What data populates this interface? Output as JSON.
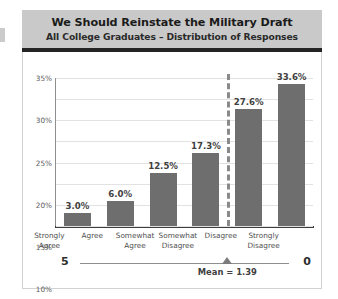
{
  "header": {
    "title": "We Should Reinstate the Military Draft",
    "subtitle": "All College Graduates – Distribution of Responses"
  },
  "scale": {
    "left_value": "5",
    "right_value": "0",
    "mean_label": "Mean = 1.39",
    "mean_value": 1.39
  },
  "colors": {
    "bar": "#6e6e6e",
    "header_band": "#c9c9c9",
    "header_rule": "#242424",
    "gridline": "#e2e2e2",
    "mean_line": "#8a8a8a"
  },
  "chart_data": {
    "type": "bar",
    "title": "We Should Reinstate the Military Draft",
    "subtitle": "All College Graduates – Distribution of Responses",
    "xlabel": "",
    "ylabel": "",
    "categories": [
      "Strongly Agree",
      "Agree",
      "Somewhat Agree",
      "Somewhat Disagree",
      "Disagree",
      "Strongly Disagree"
    ],
    "category_lines": [
      [
        "Strongly",
        "Agree"
      ],
      [
        "Agree",
        ""
      ],
      [
        "Somewhat",
        "Agree"
      ],
      [
        "Somewhat",
        "Disagree"
      ],
      [
        "Disagree",
        ""
      ],
      [
        "Strongly",
        "Disagree"
      ]
    ],
    "values": [
      3.0,
      6.0,
      12.5,
      17.3,
      27.6,
      33.6
    ],
    "data_labels": [
      "3.0%",
      "6.0%",
      "12.5%",
      "17.3%",
      "27.6%",
      "33.6%"
    ],
    "ylim": [
      0,
      35
    ],
    "ytick_values": [
      0,
      5,
      10,
      15,
      20,
      25,
      30,
      35
    ],
    "ytick_labels": [
      "0%",
      "5%",
      "10%",
      "15%",
      "20%",
      "25%",
      "30%",
      "35%"
    ],
    "grid": true,
    "legend": "none",
    "annotations": [
      {
        "type": "vertical-dashed-line",
        "label": "Mean = 1.39",
        "position_between_categories": [
          3,
          4
        ]
      }
    ]
  }
}
